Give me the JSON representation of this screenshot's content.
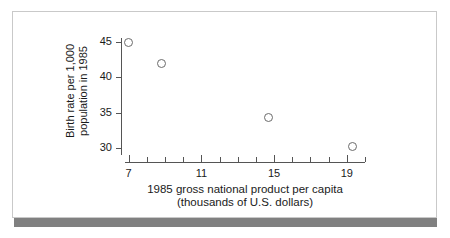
{
  "chart_data": {
    "type": "scatter",
    "title": "",
    "xlabel": "1985 gross national product per capita (thousands of U.S. dollars)",
    "xlabel_line1": "1985 gross national product per capita",
    "xlabel_line2": "(thousands of U.S. dollars)",
    "ylabel": "Birth rate per 1,000 population in 1985",
    "ylabel_line1": "Birth rate per 1,000",
    "ylabel_line2": "population in 1985",
    "xlim": [
      6.8,
      20.0
    ],
    "ylim": [
      29.0,
      45.6
    ],
    "grid": false,
    "legend": null,
    "marker": "open-circle",
    "x_major_ticks": [
      7,
      11,
      15,
      19
    ],
    "x_major_tick_labels": [
      "7",
      "11",
      "15",
      "19"
    ],
    "x_minor_ticks": [
      8,
      9,
      10,
      12,
      13,
      14,
      16,
      17,
      18,
      20
    ],
    "y_ticks": [
      30,
      35,
      40,
      45
    ],
    "y_tick_labels": [
      "30",
      "35",
      "40",
      "45"
    ],
    "points": [
      {
        "x": 7.0,
        "y": 45.0
      },
      {
        "x": 8.8,
        "y": 42.0
      },
      {
        "x": 14.7,
        "y": 34.3
      },
      {
        "x": 19.3,
        "y": 30.2
      }
    ]
  },
  "colors": {
    "frame_border": "#c9c9c9",
    "bottom_bar": "#808080",
    "axis": "#555555",
    "marker_stroke": "#6b6b6b",
    "text": "#1a1a1a",
    "background": "#ffffff"
  }
}
